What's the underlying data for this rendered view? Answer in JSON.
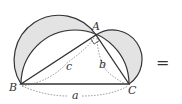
{
  "diagram": {
    "points": {
      "A": "A",
      "B": "B",
      "C": "C"
    },
    "sides": {
      "a": "a",
      "b": "b",
      "c": "c"
    },
    "operator": "=",
    "colors": {
      "fill": "#e3e3e3",
      "stroke": "#333333",
      "dashed": "#666666"
    }
  }
}
